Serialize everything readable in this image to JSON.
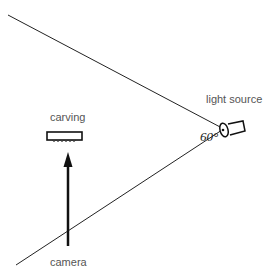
{
  "diagram": {
    "labels": {
      "light_source": "light source",
      "carving": "carving",
      "camera": "camera",
      "angle": "60°"
    },
    "colors": {
      "line": "#222222",
      "text": "#555555"
    }
  }
}
